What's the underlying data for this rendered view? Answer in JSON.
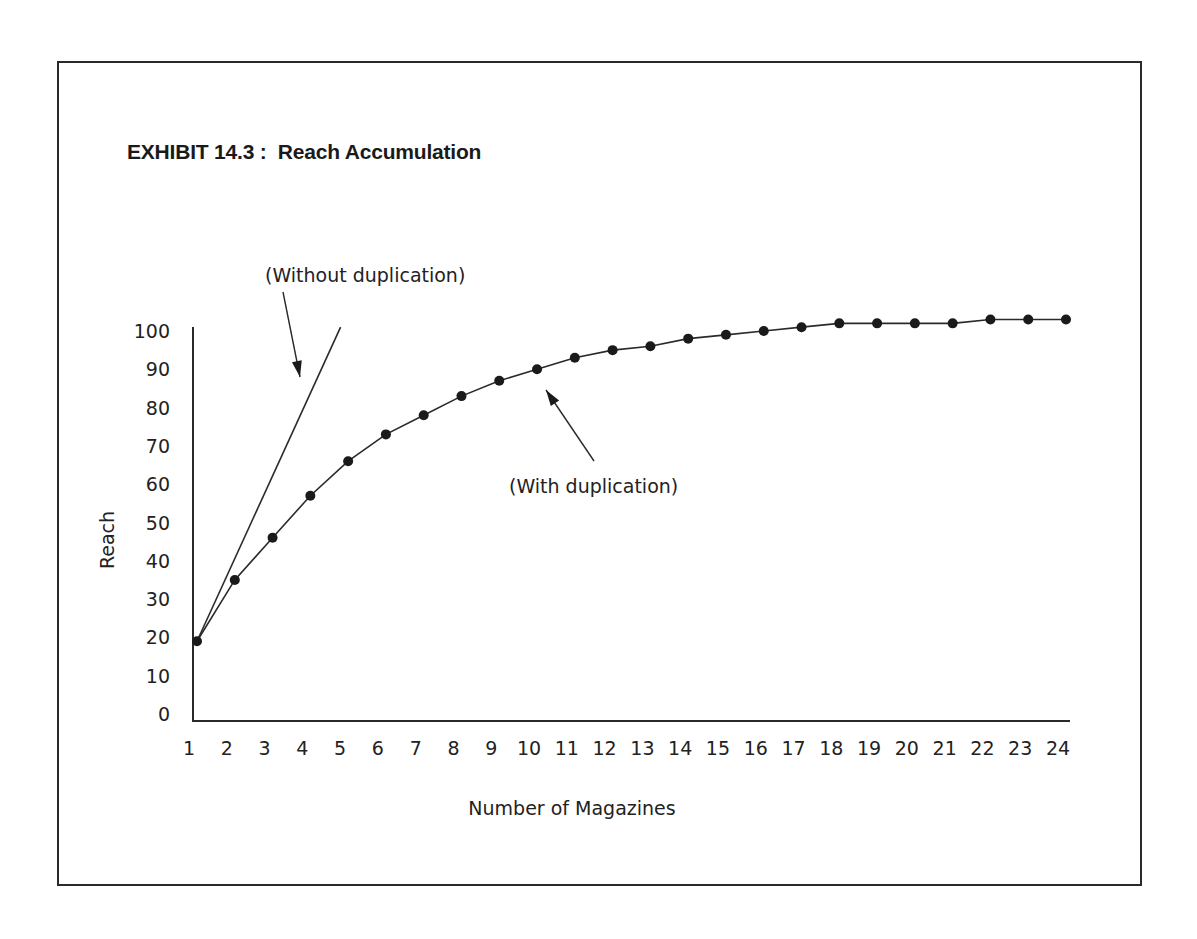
{
  "chart_data": {
    "type": "line",
    "title": "EXHIBIT 14.3 :  Reach Accumulation",
    "xlabel": "Number of Magazines",
    "ylabel": "Reach",
    "x": [
      1,
      2,
      3,
      4,
      5,
      6,
      7,
      8,
      9,
      10,
      11,
      12,
      13,
      14,
      15,
      16,
      17,
      18,
      19,
      20,
      21,
      22,
      23,
      24
    ],
    "x_ticks": [
      "1",
      "2",
      "3",
      "4",
      "5",
      "6",
      "7",
      "8",
      "9",
      "10",
      "11",
      "12",
      "13",
      "14",
      "15",
      "16",
      "17",
      "18",
      "19",
      "20",
      "21",
      "22",
      "23",
      "24"
    ],
    "y_ticks": [
      "0",
      "10",
      "20",
      "30",
      "40",
      "50",
      "60",
      "70",
      "80",
      "90",
      "100"
    ],
    "xlim": [
      1,
      24
    ],
    "ylim": [
      0,
      100
    ],
    "grid": false,
    "legend": "none",
    "series": [
      {
        "name": "With duplication",
        "markers": true,
        "values": [
          19,
          35,
          46,
          57,
          66,
          73,
          78,
          83,
          87,
          90,
          93,
          95,
          96,
          98,
          99,
          100,
          101,
          102,
          102,
          102,
          102,
          103,
          103,
          103
        ]
      },
      {
        "name": "Without duplication",
        "markers": false,
        "points": [
          [
            1,
            19
          ],
          [
            4.8,
            101
          ]
        ]
      }
    ],
    "annotations": [
      {
        "text": "(Without duplication)",
        "target_series": "Without duplication",
        "arrow": true
      },
      {
        "text": "(With duplication)",
        "target_series": "With duplication",
        "arrow": true
      }
    ]
  }
}
